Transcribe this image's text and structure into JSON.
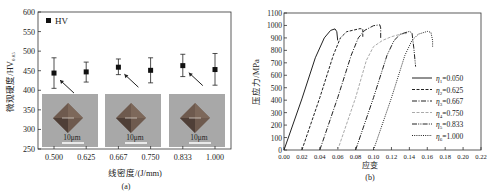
{
  "chart_data": [
    {
      "panel": "(a)",
      "type": "scatter",
      "title": "",
      "xlabel": "线密度/(J/mm)",
      "ylabel": "微观硬度/HV0.05",
      "ylabel_main": "微观硬度/HV",
      "ylabel_sub": "0.05",
      "ylim": [
        250,
        600
      ],
      "yticks": [
        250,
        300,
        350,
        400,
        450,
        500,
        550,
        600
      ],
      "categories": [
        "0.500",
        "0.625",
        "0.667",
        "0.750",
        "0.833",
        "1.000"
      ],
      "series": [
        {
          "name": "HV",
          "values": [
            444,
            447,
            459,
            451,
            463,
            453
          ],
          "error_low": [
            405,
            421,
            440,
            419,
            435,
            413
          ],
          "error_high": [
            483,
            472,
            480,
            483,
            492,
            494
          ]
        }
      ],
      "legend": {
        "label": "HV",
        "position": "top-left"
      },
      "insets": [
        {
          "scale_label": "10μm",
          "points_to": "0.500"
        },
        {
          "scale_label": "10μm",
          "points_to": "0.667"
        },
        {
          "scale_label": "10μm",
          "points_to": "0.833"
        }
      ],
      "caption": "(a)"
    },
    {
      "panel": "(b)",
      "type": "line",
      "title": "",
      "xlabel": "应变",
      "ylabel": "压应力/MPa",
      "xlim": [
        0,
        0.22
      ],
      "ylim": [
        0,
        1100
      ],
      "xticks": [
        "0.00",
        "0.02",
        "0.04",
        "0.06",
        "0.08",
        "0.10",
        "0.12",
        "0.14",
        "0.16",
        "0.18",
        "0.20",
        "0.22"
      ],
      "yticks": [
        "0",
        "100",
        "200",
        "300",
        "400",
        "500",
        "600",
        "700",
        "800",
        "900",
        "1000",
        "1100"
      ],
      "series": [
        {
          "name": "η1=0.050",
          "sym": "η",
          "sub": "1",
          "val": "=0.050",
          "style": "solid",
          "color": "#222222",
          "points": [
            [
              0.0,
              0
            ],
            [
              0.02,
              410
            ],
            [
              0.035,
              740
            ],
            [
              0.045,
              900
            ],
            [
              0.052,
              960
            ],
            [
              0.057,
              972
            ],
            [
              0.059,
              950
            ],
            [
              0.06,
              880
            ]
          ]
        },
        {
          "name": "η2=0.625",
          "sym": "η",
          "sub": "2",
          "val": "=0.625",
          "style": "dashed",
          "color": "#222222",
          "points": [
            [
              0.02,
              0
            ],
            [
              0.04,
              420
            ],
            [
              0.055,
              760
            ],
            [
              0.063,
              900
            ],
            [
              0.07,
              950
            ],
            [
              0.085,
              975
            ],
            [
              0.088,
              970
            ],
            [
              0.088,
              900
            ]
          ]
        },
        {
          "name": "η3=0.667",
          "sym": "η",
          "sub": "3",
          "val": "=0.667",
          "style": "dashdot",
          "color": "#222222",
          "points": [
            [
              0.04,
              0
            ],
            [
              0.06,
              420
            ],
            [
              0.075,
              760
            ],
            [
              0.083,
              900
            ],
            [
              0.09,
              960
            ],
            [
              0.1,
              998
            ],
            [
              0.107,
              1005
            ],
            [
              0.108,
              980
            ],
            [
              0.108,
              890
            ]
          ]
        },
        {
          "name": "η4=0.750",
          "sym": "η",
          "sub": "4",
          "val": "=0.750",
          "style": "dashed",
          "color": "#aaaaaa",
          "points": [
            [
              0.06,
              0
            ],
            [
              0.08,
              420
            ],
            [
              0.092,
              720
            ],
            [
              0.1,
              830
            ],
            [
              0.11,
              880
            ],
            [
              0.12,
              910
            ],
            [
              0.13,
              930
            ],
            [
              0.137,
              935
            ]
          ]
        },
        {
          "name": "η5=0.833",
          "sym": "η",
          "sub": "5",
          "val": "=0.833",
          "style": "dashdotdot",
          "color": "#222222",
          "points": [
            [
              0.08,
              0
            ],
            [
              0.1,
              420
            ],
            [
              0.115,
              760
            ],
            [
              0.123,
              880
            ],
            [
              0.13,
              930
            ],
            [
              0.14,
              952
            ],
            [
              0.143,
              940
            ],
            [
              0.145,
              820
            ],
            [
              0.147,
              670
            ]
          ]
        },
        {
          "name": "η6=1.000",
          "sym": "η",
          "sub": "6",
          "val": "=1.000",
          "style": "dotted",
          "color": "#222222",
          "points": [
            [
              0.1,
              0
            ],
            [
              0.12,
              420
            ],
            [
              0.135,
              760
            ],
            [
              0.143,
              880
            ],
            [
              0.15,
              930
            ],
            [
              0.16,
              952
            ],
            [
              0.164,
              945
            ],
            [
              0.166,
              880
            ],
            [
              0.166,
              830
            ]
          ]
        }
      ],
      "legend": {
        "position": "right-center"
      },
      "caption": "(b)"
    }
  ]
}
